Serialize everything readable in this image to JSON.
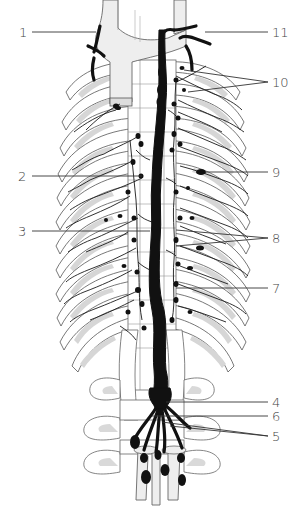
{
  "figure": {
    "labels": [
      {
        "id": "1",
        "text": "1",
        "x": 19,
        "y": 27,
        "side": "left"
      },
      {
        "id": "11",
        "text": "11",
        "x": 273,
        "y": 27,
        "side": "right"
      },
      {
        "id": "10",
        "text": "10",
        "x": 272,
        "y": 76,
        "side": "right"
      },
      {
        "id": "2",
        "text": "2",
        "x": 18,
        "y": 171,
        "side": "left"
      },
      {
        "id": "9",
        "text": "9",
        "x": 272,
        "y": 166,
        "side": "right"
      },
      {
        "id": "3",
        "text": "3",
        "x": 18,
        "y": 226,
        "side": "left"
      },
      {
        "id": "8",
        "text": "8",
        "x": 272,
        "y": 232,
        "side": "right"
      },
      {
        "id": "7",
        "text": "7",
        "x": 272,
        "y": 282,
        "side": "right"
      },
      {
        "id": "4",
        "text": "4",
        "x": 272,
        "y": 396,
        "side": "right"
      },
      {
        "id": "6",
        "text": "6",
        "x": 272,
        "y": 411,
        "side": "right"
      },
      {
        "id": "5",
        "text": "5",
        "x": 272,
        "y": 430,
        "side": "right"
      }
    ]
  }
}
